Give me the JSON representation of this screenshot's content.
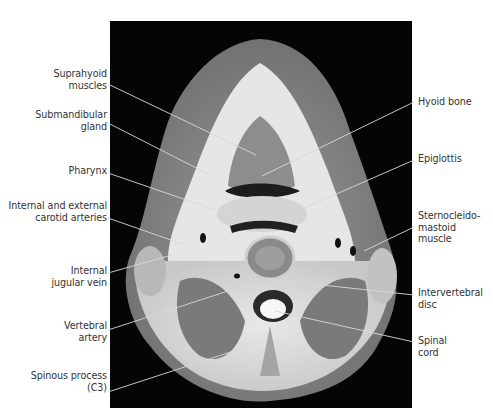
{
  "figure": {
    "labels_left": [
      {
        "id": "suprahyoid",
        "text_lines": [
          "Suprahyoid",
          "muscles"
        ]
      },
      {
        "id": "submandibular",
        "text_lines": [
          "Submandibular",
          "gland"
        ]
      },
      {
        "id": "pharynx",
        "text_lines": [
          "Pharynx"
        ]
      },
      {
        "id": "carotid",
        "text_lines": [
          "Internal and external",
          "carotid arteries"
        ]
      },
      {
        "id": "jugular",
        "text_lines": [
          "Internal",
          "jugular vein"
        ]
      },
      {
        "id": "vertebral-artery",
        "text_lines": [
          "Vertebral",
          "artery"
        ]
      },
      {
        "id": "spinous",
        "text_lines": [
          "Spinous process",
          "(C3)"
        ]
      }
    ],
    "labels_right": [
      {
        "id": "hyoid",
        "text_lines": [
          "Hyoid bone"
        ]
      },
      {
        "id": "epiglottis",
        "text_lines": [
          "Epiglottis"
        ]
      },
      {
        "id": "scm",
        "text_lines": [
          "Sternocleido-",
          "mastoid",
          "muscle"
        ]
      },
      {
        "id": "disc",
        "text_lines": [
          "Intervertebral",
          "disc"
        ]
      },
      {
        "id": "cord",
        "text_lines": [
          "Spinal",
          "cord"
        ]
      }
    ]
  }
}
